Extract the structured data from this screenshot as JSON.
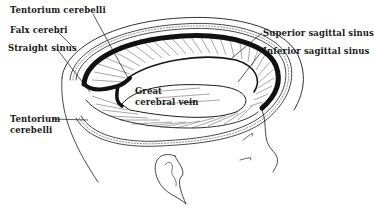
{
  "diagram": {
    "labels": {
      "tentorium_cerebelli_top": "Tentorium cerebelli",
      "falx_cerebri": "Falx cerebri",
      "straight_sinus": "Straight sinus",
      "superior_sagittal_sinus": "Superior sagittal sinus",
      "inferior_sagittal_sinus": "Inferior sagittal sinus",
      "great_cerebral_vein_line1": "Great",
      "great_cerebral_vein_line2": "cerebral vein",
      "tentorium_cerebelli_bottom_line1": "Tentorium",
      "tentorium_cerebelli_bottom_line2": "cerebelli"
    },
    "colors": {
      "ink": "#1a1a1a",
      "background": "#ffffff"
    }
  }
}
